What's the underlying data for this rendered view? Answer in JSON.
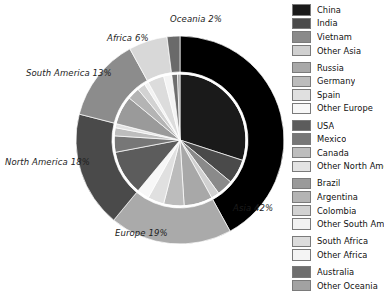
{
  "chart_data": {
    "type": "pie",
    "title": "",
    "subtitle": "",
    "xlabel": "",
    "ylabel": "",
    "grid": false,
    "legend_position": "right",
    "outer": {
      "name": "Continents",
      "categories": [
        "Asia",
        "Europe",
        "North America",
        "South America",
        "Africa",
        "Oceania"
      ],
      "values": [
        42,
        19,
        18,
        13,
        6,
        2
      ],
      "labels": [
        "Asia 42%",
        "Europe 19%",
        "North America 18%",
        "South America 13%",
        "Africa 6%",
        "Oceania 2%"
      ],
      "colors": [
        "#000000",
        "#aaaaaa",
        "#4a4a4a",
        "#8c8c8c",
        "#d8d8d8",
        "#6a6a6a"
      ]
    },
    "inner": {
      "name": "Countries",
      "categories": [
        "China",
        "India",
        "Vietnam",
        "Other Asia",
        "Russia",
        "Germany",
        "Spain",
        "Other Europe",
        "USA",
        "Mexico",
        "Canada",
        "Other North America",
        "Brazil",
        "Argentina",
        "Colombia",
        "Other South America",
        "South Africa",
        "Other Africa",
        "Australia",
        "Other Oceania"
      ],
      "values": [
        30,
        6,
        4,
        2,
        7,
        5,
        4,
        3,
        11,
        4,
        2,
        1,
        7,
        3,
        2,
        1,
        4,
        2,
        1.4,
        0.6
      ],
      "colors": [
        "#1a1a1a",
        "#4a4a4a",
        "#8a8a8a",
        "#d0d0d0",
        "#a8a8a8",
        "#bcbcbc",
        "#e0e0e0",
        "#f7f7f7",
        "#5c5c5c",
        "#777777",
        "#bdbdbd",
        "#e3e3e3",
        "#9a9a9a",
        "#b4b4b4",
        "#d2d2d2",
        "#f2f2f2",
        "#dcdcdc",
        "#f4f4f4",
        "#6e6e6e",
        "#a2a2a2"
      ]
    }
  },
  "pie_labels": [
    {
      "text": "Oceania 2%",
      "name": "pie-label-oceania"
    },
    {
      "text": "Africa 6%",
      "name": "pie-label-africa"
    },
    {
      "text": "South America 13%",
      "name": "pie-label-south-america"
    },
    {
      "text": "North America 18%",
      "name": "pie-label-north-america"
    },
    {
      "text": "Europe 19%",
      "name": "pie-label-europe"
    },
    {
      "text": "Asia 42%",
      "name": "pie-label-asia"
    }
  ],
  "legend": {
    "groups": [
      {
        "name": "asia",
        "items": [
          {
            "label": "China",
            "color": "#1a1a1a"
          },
          {
            "label": "India",
            "color": "#4a4a4a"
          },
          {
            "label": "Vietnam",
            "color": "#8a8a8a"
          },
          {
            "label": "Other Asia",
            "color": "#d0d0d0"
          }
        ]
      },
      {
        "name": "europe",
        "items": [
          {
            "label": "Russia",
            "color": "#a8a8a8"
          },
          {
            "label": "Germany",
            "color": "#bcbcbc"
          },
          {
            "label": "Spain",
            "color": "#e0e0e0"
          },
          {
            "label": "Other Europe",
            "color": "#f7f7f7"
          }
        ]
      },
      {
        "name": "north-america",
        "items": [
          {
            "label": "USA",
            "color": "#5c5c5c"
          },
          {
            "label": "Mexico",
            "color": "#777777"
          },
          {
            "label": "Canada",
            "color": "#bdbdbd"
          },
          {
            "label": "Other North Ame",
            "color": "#e3e3e3"
          }
        ]
      },
      {
        "name": "south-america",
        "items": [
          {
            "label": "Brazil",
            "color": "#9a9a9a"
          },
          {
            "label": "Argentina",
            "color": "#b4b4b4"
          },
          {
            "label": "Colombia",
            "color": "#d2d2d2"
          },
          {
            "label": "Other South Ame",
            "color": "#f2f2f2"
          }
        ]
      },
      {
        "name": "africa",
        "items": [
          {
            "label": "South Africa",
            "color": "#dcdcdc"
          },
          {
            "label": "Other Africa",
            "color": "#f4f4f4"
          }
        ]
      },
      {
        "name": "oceania",
        "items": [
          {
            "label": "Australia",
            "color": "#6e6e6e"
          },
          {
            "label": "Other Oceania",
            "color": "#a2a2a2"
          }
        ]
      }
    ]
  }
}
